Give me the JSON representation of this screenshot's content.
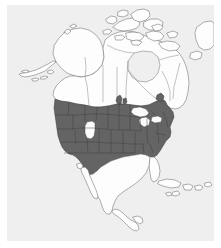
{
  "figure": {
    "caption": "",
    "panel_background": "#efefef",
    "page_background": "#ffffff"
  },
  "map": {
    "name": "north-america-range-map",
    "projection_region": "North America",
    "land_fill": "#fdfdfd",
    "land_outline": "#6e6e6e",
    "ocean_fill": "#efefef",
    "range_fill": "#646464",
    "range_outline": "#3a3a3a",
    "hole_fill": "#fbfbfb",
    "regions": [
      {
        "id": "alaska",
        "label": "Alaska",
        "shaded": false
      },
      {
        "id": "canada",
        "label": "Canada",
        "shaded": false
      },
      {
        "id": "arctic-islands",
        "label": "Canadian Arctic Archipelago",
        "shaded": false
      },
      {
        "id": "greenland-edge",
        "label": "Greenland (partial)",
        "shaded": false
      },
      {
        "id": "contiguous-us",
        "label": "Contiguous United States",
        "shaded": true
      },
      {
        "id": "mexico",
        "label": "Mexico",
        "shaded": false
      },
      {
        "id": "central-america",
        "label": "Central America",
        "shaded": false
      },
      {
        "id": "caribbean",
        "label": "Caribbean islands",
        "shaded": false
      }
    ],
    "unshaded_inclusions": [
      {
        "id": "great-basin-gap",
        "label": "Great Basin / Utah gap"
      },
      {
        "id": "great-lakes",
        "label": "Great Lakes"
      },
      {
        "id": "florida-peninsula-gap",
        "label": "Southern Florida peninsula"
      }
    ],
    "legend": {
      "shown": false,
      "shaded_meaning": "Distribution range",
      "unshaded_meaning": "Outside range"
    }
  }
}
